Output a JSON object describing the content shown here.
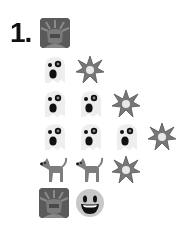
{
  "puzzle": {
    "number_label": "1.",
    "header_icon": "statue-of-liberty-icon",
    "rows": [
      {
        "icons": [
          "ghost-icon",
          "collision-icon"
        ]
      },
      {
        "icons": [
          "ghost-icon",
          "ghost-icon",
          "collision-icon"
        ]
      },
      {
        "icons": [
          "ghost-icon",
          "ghost-icon",
          "ghost-icon",
          "collision-icon"
        ]
      },
      {
        "icons": [
          "dog-icon",
          "dog-icon",
          "collision-icon"
        ]
      },
      {
        "icons": [
          "statue-of-liberty-icon",
          "grinning-face-icon"
        ]
      }
    ]
  }
}
